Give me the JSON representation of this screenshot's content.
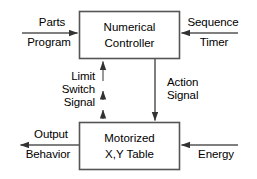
{
  "diagram": {
    "type": "block-diagram",
    "blocks": [
      {
        "id": "numerical-controller",
        "line1": "Numerical",
        "line2": "Controller"
      },
      {
        "id": "motorized-table",
        "line1": "Motorized",
        "line2": "X,Y Table"
      }
    ],
    "signals": {
      "parts_program_top": "Parts",
      "parts_program_bottom": "Program",
      "sequence_timer_top": "Sequence",
      "sequence_timer_bottom": "Timer",
      "limit_switch_signal_line1": "Limit",
      "limit_switch_signal_line2": "Switch",
      "limit_switch_signal_line3": "Signal",
      "action_signal_line1": "Action",
      "action_signal_line2": "Signal",
      "output_behavior_top": "Output",
      "output_behavior_bottom": "Behavior",
      "energy": "Energy"
    },
    "colors": {
      "stroke": "#444444",
      "text": "#000000",
      "background": "#ffffff"
    }
  }
}
